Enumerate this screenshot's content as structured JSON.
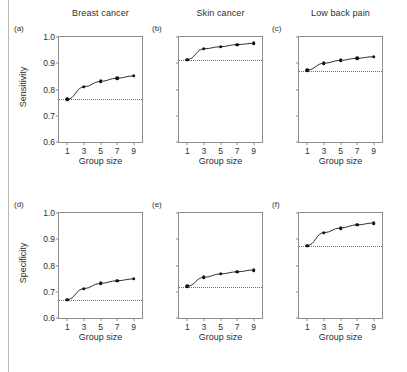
{
  "figure": {
    "xlabel": "Group size",
    "ylabel_top_row": "Sensitivity",
    "ylabel_bottom_row": "Specificity",
    "x_ticks": [
      "1",
      "3",
      "5",
      "7",
      "9"
    ],
    "y_ticks": [
      "1.0",
      "0.9",
      "0.8",
      "0.7",
      "0.6"
    ]
  },
  "chart_data": [
    {
      "type": "line",
      "panel": "a",
      "panel_label": "(a)",
      "title": "Breast cancer",
      "xlabel": "Group size",
      "ylabel": "Sensitivity",
      "x": [
        1,
        3,
        5,
        7,
        9
      ],
      "values": [
        0.762,
        0.81,
        0.831,
        0.843,
        0.852
      ],
      "reference_line": 0.762,
      "xlim": [
        0,
        10
      ],
      "ylim": [
        0.6,
        1.0
      ],
      "xticks": [
        1,
        3,
        5,
        7,
        9
      ],
      "yticks": [
        0.6,
        0.7,
        0.8,
        0.9,
        1.0
      ],
      "grid": false,
      "legend": "none"
    },
    {
      "type": "line",
      "panel": "b",
      "panel_label": "(b)",
      "title": "Skin cancer",
      "xlabel": "Group size",
      "ylabel": "Sensitivity",
      "x": [
        1,
        3,
        5,
        7,
        9
      ],
      "values": [
        0.914,
        0.955,
        0.963,
        0.971,
        0.976
      ],
      "reference_line": 0.913,
      "xlim": [
        0,
        10
      ],
      "ylim": [
        0.6,
        1.0
      ],
      "xticks": [
        1,
        3,
        5,
        7,
        9
      ],
      "yticks": [
        0.6,
        0.7,
        0.8,
        0.9,
        1.0
      ],
      "grid": false,
      "legend": "none"
    },
    {
      "type": "line",
      "panel": "c",
      "panel_label": "(c)",
      "title": "Low back pain",
      "xlabel": "Group size",
      "ylabel": "Sensitivity",
      "x": [
        1,
        3,
        5,
        7,
        9
      ],
      "values": [
        0.874,
        0.9,
        0.911,
        0.919,
        0.925
      ],
      "reference_line": 0.871,
      "xlim": [
        0,
        10
      ],
      "ylim": [
        0.6,
        1.0
      ],
      "xticks": [
        1,
        3,
        5,
        7,
        9
      ],
      "yticks": [
        0.6,
        0.7,
        0.8,
        0.9,
        1.0
      ],
      "grid": false,
      "legend": "none"
    },
    {
      "type": "line",
      "panel": "d",
      "panel_label": "(d)",
      "title": "Breast cancer",
      "xlabel": "Group size",
      "ylabel": "Specificity",
      "x": [
        1,
        3,
        5,
        7,
        9
      ],
      "values": [
        0.67,
        0.712,
        0.732,
        0.742,
        0.749
      ],
      "reference_line": 0.668,
      "xlim": [
        0,
        10
      ],
      "ylim": [
        0.6,
        1.0
      ],
      "xticks": [
        1,
        3,
        5,
        7,
        9
      ],
      "yticks": [
        0.6,
        0.7,
        0.8,
        0.9,
        1.0
      ],
      "grid": false,
      "legend": "none"
    },
    {
      "type": "line",
      "panel": "e",
      "panel_label": "(e)",
      "title": "Skin cancer",
      "xlabel": "Group size",
      "ylabel": "Specificity",
      "x": [
        1,
        3,
        5,
        7,
        9
      ],
      "values": [
        0.721,
        0.755,
        0.768,
        0.776,
        0.783
      ],
      "reference_line": 0.719,
      "xlim": [
        0,
        10
      ],
      "ylim": [
        0.6,
        1.0
      ],
      "xticks": [
        1,
        3,
        5,
        7,
        9
      ],
      "yticks": [
        0.6,
        0.7,
        0.8,
        0.9,
        1.0
      ],
      "grid": false,
      "legend": "none"
    },
    {
      "type": "line",
      "panel": "f",
      "panel_label": "(f)",
      "title": "Low back pain",
      "xlabel": "Group size",
      "ylabel": "Specificity",
      "x": [
        1,
        3,
        5,
        7,
        9
      ],
      "values": [
        0.876,
        0.925,
        0.943,
        0.955,
        0.962
      ],
      "reference_line": 0.874,
      "xlim": [
        0,
        10
      ],
      "ylim": [
        0.6,
        1.0
      ],
      "xticks": [
        1,
        3,
        5,
        7,
        9
      ],
      "yticks": [
        0.6,
        0.7,
        0.8,
        0.9,
        1.0
      ],
      "grid": false,
      "legend": "none"
    }
  ]
}
